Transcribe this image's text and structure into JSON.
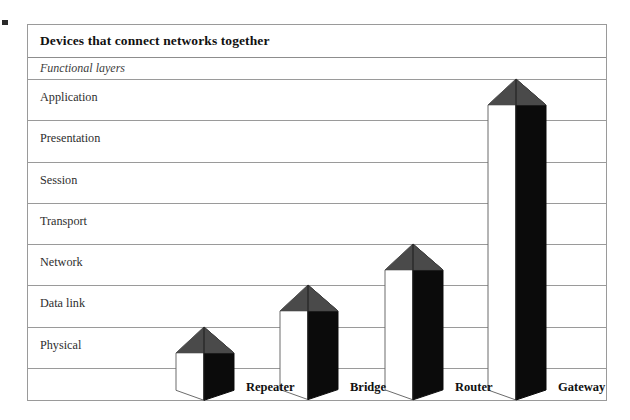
{
  "figure": {
    "title": "Devices that connect networks together",
    "subtitle": "Functional layers"
  },
  "colors": {
    "frame": "#9a9a9a",
    "bar_dark_face": "#0b0b0b",
    "bar_top_face": "#4a4a4a",
    "bar_light_face": "#ffffff",
    "text": "#111111",
    "background": "#ffffff"
  },
  "chart_data": {
    "type": "bar",
    "title": "Devices that connect networks together",
    "subtitle": "Functional layers",
    "xlabel": "",
    "ylabel": "Functional layers",
    "orientation": "vertical",
    "style": "3d-isometric-column",
    "grid": true,
    "legend": "none",
    "categories": [
      "Repeater",
      "Bridge",
      "Router",
      "Gateway"
    ],
    "values": [
      1,
      2,
      3,
      7
    ],
    "value_unit": "OSI layers spanned",
    "ylim": [
      0,
      7
    ],
    "layers": [
      "Application",
      "Presentation",
      "Session",
      "Transport",
      "Network",
      "Data link",
      "Physical"
    ],
    "layer_numbers": [
      7,
      6,
      5,
      4,
      3,
      2,
      1
    ],
    "bars": [
      {
        "name": "Repeater",
        "top_layer": "Physical",
        "layers_spanned": 1,
        "height_layers": 1
      },
      {
        "name": "Bridge",
        "top_layer": "Data link",
        "layers_spanned": 2,
        "height_layers": 2
      },
      {
        "name": "Router",
        "top_layer": "Network",
        "layers_spanned": 3,
        "height_layers": 3
      },
      {
        "name": "Gateway",
        "top_layer": "Application",
        "layers_spanned": 7,
        "height_layers": 7
      }
    ]
  },
  "rows": [
    {
      "label": "Application"
    },
    {
      "label": "Presentation"
    },
    {
      "label": "Session"
    },
    {
      "label": "Transport"
    },
    {
      "label": "Network"
    },
    {
      "label": "Data link"
    },
    {
      "label": "Physical"
    }
  ],
  "devices": [
    {
      "label": "Repeater"
    },
    {
      "label": "Bridge"
    },
    {
      "label": "Router"
    },
    {
      "label": "Gateway"
    }
  ]
}
